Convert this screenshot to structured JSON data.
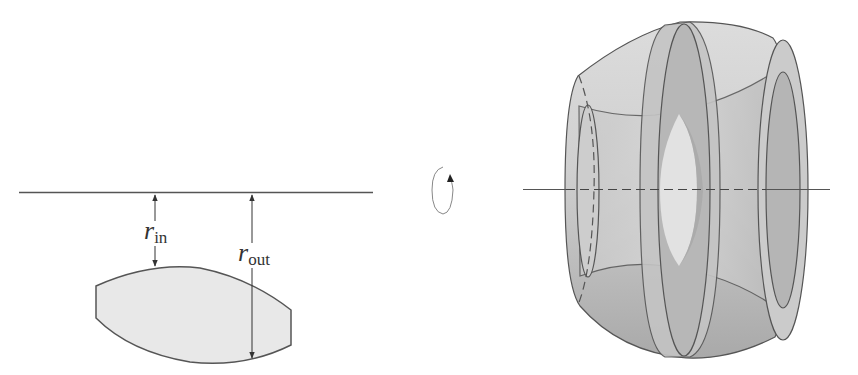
{
  "diagram": {
    "type": "solid-of-revolution",
    "left_panel": {
      "axis": "axis-of-rotation",
      "region": "cross-section-region",
      "labels": {
        "r_in": {
          "main": "r",
          "sub": "in"
        },
        "r_out": {
          "main": "r",
          "sub": "out"
        }
      }
    },
    "middle": {
      "icon": "rotation-arrow-icon"
    },
    "right_panel": {
      "solid": "solid-of-revolution-with-hole",
      "axis": "axis-of-rotation"
    },
    "colors": {
      "stroke": "#4a4a4a",
      "region_fill": "#e6e6e6",
      "solid_light": "#d9d9d9",
      "solid_mid": "#bdbdbd",
      "solid_dark": "#a8a8a8",
      "inner_lens": "#e4e4e4"
    }
  }
}
